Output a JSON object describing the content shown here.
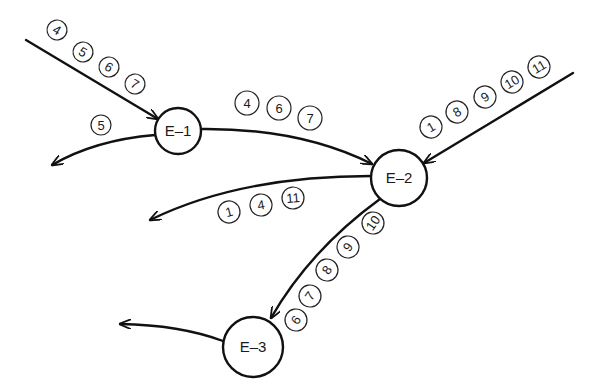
{
  "diagram": {
    "nodes": [
      {
        "id": "E-1",
        "label": "E–1",
        "cx": 178,
        "cy": 131,
        "r": 23
      },
      {
        "id": "E-2",
        "label": "E–2",
        "cx": 399,
        "cy": 178,
        "r": 28
      },
      {
        "id": "E-3",
        "label": "E–3",
        "cx": 253,
        "cy": 347,
        "r": 30
      }
    ],
    "edges": [
      {
        "name": "input-to-e1",
        "from": "external",
        "to": "E-1",
        "items": [
          "4",
          "5",
          "6",
          "7"
        ]
      },
      {
        "name": "e1-output",
        "from": "E-1",
        "to": "external",
        "items": [
          "5"
        ]
      },
      {
        "name": "e1-to-e2",
        "from": "E-1",
        "to": "E-2",
        "items": [
          "4",
          "6",
          "7"
        ]
      },
      {
        "name": "input-to-e2",
        "from": "external",
        "to": "E-2",
        "items": [
          "1",
          "8",
          "9",
          "10",
          "11"
        ]
      },
      {
        "name": "e2-output",
        "from": "E-2",
        "to": "external",
        "items": [
          "1",
          "4",
          "11"
        ]
      },
      {
        "name": "e2-to-e3",
        "from": "E-2",
        "to": "E-3",
        "items": [
          "6",
          "7",
          "8",
          "9",
          "10"
        ]
      },
      {
        "name": "e3-output",
        "from": "E-3",
        "to": "external",
        "items": []
      }
    ]
  }
}
